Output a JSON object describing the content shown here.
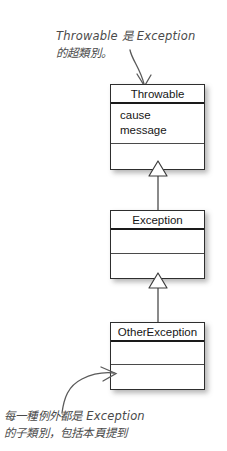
{
  "diagram": {
    "background_color": "#ffffff",
    "line_color": "#3c3c3c",
    "ink_color": "#5a5a5a",
    "text_color": "#161616"
  },
  "annotations": {
    "top": {
      "text": "Throwable 是 Exception\n的超類別。",
      "lines": [
        "Throwable 是 Exception",
        "的超類別。"
      ]
    },
    "bottom": {
      "text": "每一種例外都是 Exception\n的子類別，包括本頁提到",
      "lines": [
        "每一種例外都是 Exception",
        "的子類別，包括本頁提到"
      ]
    }
  },
  "classes": [
    {
      "name": "Throwable",
      "attributes": [
        "cause",
        "message"
      ],
      "operations": []
    },
    {
      "name": "Exception",
      "attributes": [],
      "operations": []
    },
    {
      "name": "OtherException",
      "attributes": [],
      "operations": []
    }
  ],
  "relationships": [
    {
      "type": "generalization",
      "from": "Exception",
      "to": "Throwable"
    },
    {
      "type": "generalization",
      "from": "OtherException",
      "to": "Exception"
    }
  ],
  "callouts": [
    {
      "icon": "curved-arrow-down-icon",
      "points_to": "Throwable"
    },
    {
      "icon": "curved-arrow-up-right-icon",
      "points_to": "OtherException"
    }
  ]
}
